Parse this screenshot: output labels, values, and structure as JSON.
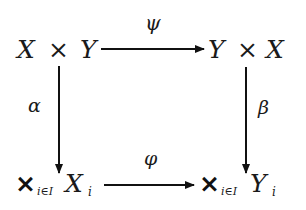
{
  "diagram": {
    "type": "commutative-diagram",
    "nodes": {
      "top_left": {
        "parts": [
          "X",
          "×",
          "Y"
        ]
      },
      "top_right": {
        "parts": [
          "Y",
          "×",
          "X"
        ]
      },
      "bottom_left": {
        "product_symbol": "×",
        "subscript": "i∈I",
        "base": "X",
        "base_subscript": "i"
      },
      "bottom_right": {
        "product_symbol": "×",
        "subscript": "i∈I",
        "base": "Y",
        "base_subscript": "i"
      }
    },
    "arrows": {
      "top": {
        "label": "ψ",
        "from": "X × Y",
        "to": "Y × X"
      },
      "left": {
        "label": "α",
        "from": "X × Y",
        "to": "×_{i∈I} X_i"
      },
      "right": {
        "label": "β",
        "from": "Y × X",
        "to": "×_{i∈I} Y_i"
      },
      "bottom": {
        "label": "φ",
        "from": "×_{i∈I} X_i",
        "to": "×_{i∈I} Y_i"
      }
    },
    "colors": {
      "ink": "#1a1a1a",
      "background": "#ffffff"
    }
  }
}
